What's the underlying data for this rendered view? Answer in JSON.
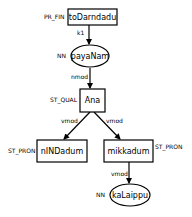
{
  "diagram": {
    "type": "dependency-tree",
    "nodes": [
      {
        "id": "n1",
        "text": "toDarndadu",
        "tag": "PR_FIN",
        "shape": "box"
      },
      {
        "id": "n2",
        "text": "payaNam",
        "tag": "NN",
        "shape": "ellipse"
      },
      {
        "id": "n3",
        "text": "Ana",
        "tag": "ST_QUAL",
        "shape": "box"
      },
      {
        "id": "n4",
        "text": "nINDadum",
        "tag": "ST_PRON",
        "shape": "box"
      },
      {
        "id": "n5",
        "text": "mikkadum",
        "tag": "ST_PRON",
        "shape": "box"
      },
      {
        "id": "n6",
        "text": "kaLaippu",
        "tag": "NN",
        "shape": "ellipse"
      }
    ],
    "edges": [
      {
        "from": "n1",
        "to": "n2",
        "label": "k1"
      },
      {
        "from": "n2",
        "to": "n3",
        "label": "nmod"
      },
      {
        "from": "n3",
        "to": "n4",
        "label": "vmod"
      },
      {
        "from": "n3",
        "to": "n5",
        "label": "vmod"
      },
      {
        "from": "n5",
        "to": "n6",
        "label": "vmod"
      }
    ]
  }
}
